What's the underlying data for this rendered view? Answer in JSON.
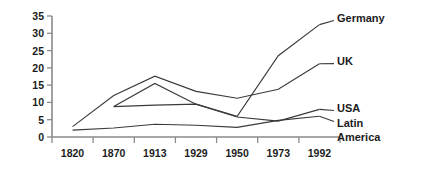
{
  "chart_data": {
    "type": "line",
    "title": "",
    "subtitle": "",
    "xlabel": "",
    "ylabel": "",
    "categories": [
      "1820",
      "1870",
      "1913",
      "1929",
      "1950",
      "1973",
      "1992"
    ],
    "ylim": [
      0,
      35
    ],
    "yticks": [
      "0",
      "5",
      "10",
      "15",
      "20",
      "25",
      "30",
      "35"
    ],
    "grid": false,
    "legend_position": "right-inline-labels",
    "series": [
      {
        "name": "Germany",
        "x": [
          "1870",
          "1913",
          "1929",
          "1950",
          "1973",
          "1992"
        ],
        "values": [
          8.8,
          15.5,
          9.5,
          6.0,
          23.5,
          32.5
        ]
      },
      {
        "name": "UK",
        "x": [
          "1820",
          "1870",
          "1913",
          "1929",
          "1950",
          "1973",
          "1992"
        ],
        "values": [
          3.0,
          12.0,
          17.6,
          13.2,
          11.2,
          13.8,
          21.2
        ]
      },
      {
        "name": "USA",
        "x": [
          "1870",
          "1913",
          "1929",
          "1950",
          "1973",
          "1992"
        ],
        "values": [
          8.8,
          9.2,
          9.5,
          5.8,
          4.6,
          8.0
        ]
      },
      {
        "name": "Latin America",
        "x": [
          "1820",
          "1870",
          "1913",
          "1929",
          "1950",
          "1973",
          "1992"
        ],
        "values": [
          2.0,
          2.6,
          3.7,
          3.4,
          2.8,
          4.8,
          6.0
        ]
      }
    ]
  },
  "labels": {
    "germany": "Germany",
    "uk": "UK",
    "usa": "USA",
    "latin": "Latin",
    "america": "America"
  }
}
